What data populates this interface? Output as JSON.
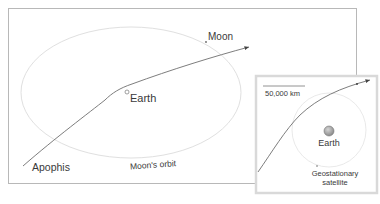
{
  "main_panel": {
    "labels": {
      "moon": "Moon",
      "earth": "Earth",
      "apophis": "Apophis",
      "moon_orbit": "Moon's orbit"
    }
  },
  "inset_panel": {
    "scale_bar": "50,000 km",
    "labels": {
      "earth": "Earth",
      "geo_line1": "Geostationary",
      "geo_line2": "satellite"
    }
  },
  "colors": {
    "frame": "#b8b8b8",
    "inset_frame": "#d8d8d8",
    "orbit": "#e2e2e2",
    "path": "#6e6e6e",
    "text": "#3a3a3a",
    "earth_fill": "#9a9a9a"
  }
}
